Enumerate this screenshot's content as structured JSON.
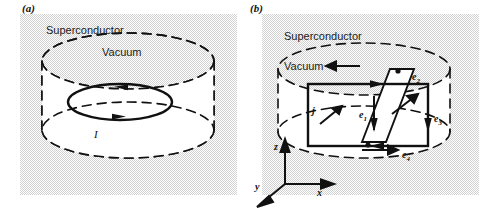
{
  "figure": {
    "width": 495,
    "height": 210,
    "background": "#ffffff",
    "panel_fill": "#d2d2d2",
    "ink": "#111111"
  },
  "panels": [
    {
      "id": "a",
      "label": "(a)",
      "region_labels": {
        "outer": "Superconductor",
        "inner": "Vacuum"
      },
      "shape": "dashed-cylinder",
      "annotations": [
        {
          "name": "current-loop-label",
          "text": "I",
          "style": "italic",
          "meaning": "circulating persistent current"
        }
      ],
      "loop": {
        "style": "solid-ellipse",
        "arrow_top": "left",
        "arrow_bottom": "right"
      }
    },
    {
      "id": "b",
      "label": "(b)",
      "region_labels": {
        "outer": "Superconductor",
        "inner": "Vacuum"
      },
      "shape": "dashed-cylinder",
      "annotations": [
        {
          "name": "current-density-label",
          "text": "j",
          "style": "italic",
          "meaning": "supercurrent density vector"
        },
        {
          "name": "edge-label-1",
          "text": "e",
          "sub": "1",
          "arrow": "down"
        },
        {
          "name": "edge-label-2",
          "text": "e",
          "sub": "2",
          "arrow": "right"
        },
        {
          "name": "edge-label-3",
          "text": "e",
          "sub": "3",
          "arrow": "down"
        },
        {
          "name": "edge-label-4",
          "text": "e",
          "sub": "4",
          "arrow": "left"
        }
      ],
      "axes": {
        "z": "z",
        "x": "x",
        "y": "y"
      }
    }
  ]
}
